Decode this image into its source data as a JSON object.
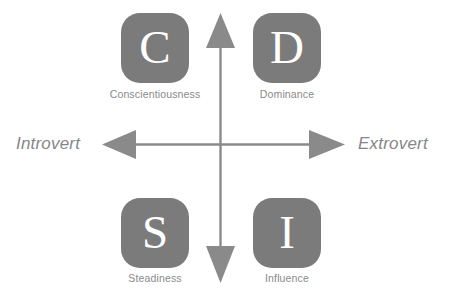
{
  "diagram": {
    "colors": {
      "tile_fill": "#7b7b7b",
      "tile_letter": "#ffffff",
      "caption_text": "#8a8a8a",
      "axis_label_text": "#868686",
      "axis_line": "#8a8a8a",
      "background": "#ffffff"
    },
    "axes": {
      "horizontal": {
        "left_label": "Introvert",
        "right_label": "Extrovert",
        "left_arrow_icon": "arrow-left-icon",
        "right_arrow_icon": "arrow-right-icon"
      },
      "vertical": {
        "top_label": "",
        "bottom_label": "",
        "up_arrow_icon": "arrow-up-icon",
        "down_arrow_icon": "arrow-down-icon"
      }
    },
    "quadrants": [
      {
        "id": "conscientiousness",
        "letter": "C",
        "caption": "Conscientiousness",
        "position": "top-left"
      },
      {
        "id": "dominance",
        "letter": "D",
        "caption": "Dominance",
        "position": "top-right"
      },
      {
        "id": "steadiness",
        "letter": "S",
        "caption": "Steadiness",
        "position": "bottom-left"
      },
      {
        "id": "influence",
        "letter": "I",
        "caption": "Influence",
        "position": "bottom-right"
      }
    ]
  }
}
